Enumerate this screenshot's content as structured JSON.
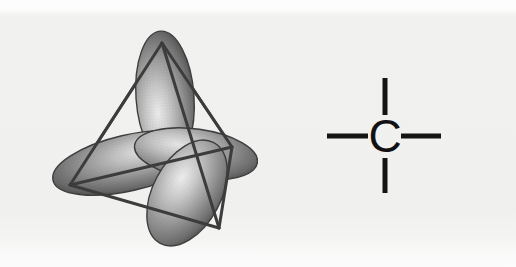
{
  "figure": {
    "background_color": "#f1f1ef",
    "panels": [
      {
        "name": "orbital-model",
        "caption": ""
      },
      {
        "name": "carbon-bond-diagram",
        "caption": ""
      }
    ]
  },
  "orbital_model": {
    "name": "sp3-tetrahedral-orbitals",
    "lobe_fill_dark": "#4f4f4f",
    "lobe_fill_mid": "#8a8a8a",
    "lobe_highlight": "#e8e8e8",
    "lobe_outline": "#3a3a3a",
    "tetrahedron_edge_color": "#3c3c3c",
    "tetrahedron_edge_width": 3,
    "vertices": [
      {
        "label": "top",
        "x": 162,
        "y": 43
      },
      {
        "label": "left",
        "x": 70,
        "y": 185
      },
      {
        "label": "right",
        "x": 232,
        "y": 147
      },
      {
        "label": "bottom-front",
        "x": 219,
        "y": 228
      }
    ],
    "lobes": [
      {
        "label": "lobe-up",
        "cx": 165,
        "cy": 97,
        "rx": 29,
        "ry": 66,
        "rotate": -4
      },
      {
        "label": "lobe-left-back",
        "cx": 128,
        "cy": 163,
        "rx": 77,
        "ry": 28,
        "rotate": -13
      },
      {
        "label": "lobe-right",
        "cx": 196,
        "cy": 154,
        "rx": 62,
        "ry": 25,
        "rotate": 8
      },
      {
        "label": "lobe-bottom-front",
        "cx": 187,
        "cy": 193,
        "rx": 34,
        "ry": 57,
        "rotate": 28
      }
    ]
  },
  "carbon_diagram": {
    "name": "carbon-atom-four-bonds",
    "atom_label": "C",
    "atom_color": "#111111",
    "bond_color": "#141414",
    "bond_width": 5,
    "bond_count": 4,
    "bonds": [
      {
        "label": "bond-top",
        "x1": 127,
        "y1": 8,
        "x2": 127,
        "y2": 45
      },
      {
        "label": "bond-bottom",
        "x1": 127,
        "y1": 88,
        "x2": 127,
        "y2": 123
      },
      {
        "label": "bond-left",
        "x1": 69,
        "y1": 66,
        "x2": 110,
        "y2": 66
      },
      {
        "label": "bond-right",
        "x1": 143,
        "y1": 66,
        "x2": 183,
        "y2": 66
      }
    ],
    "atom_position": {
      "x": 127,
      "y": 66
    }
  }
}
